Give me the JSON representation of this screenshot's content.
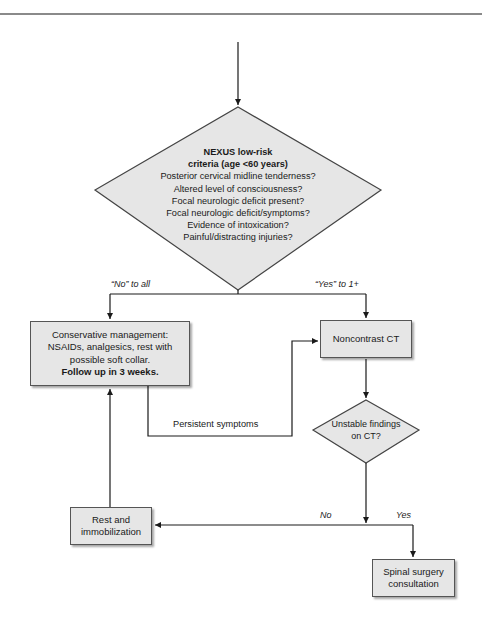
{
  "diagram": {
    "type": "flowchart",
    "colors": {
      "node_fill": "#e6e6e6",
      "stroke": "#1a1a1a",
      "rule": "#8a8a8a"
    },
    "nexus_decision": {
      "title_lines": [
        "NEXUS low-risk",
        "criteria (age <60 years)"
      ],
      "questions": [
        "Posterior cervical midline tenderness?",
        "Altered level of consciousness?",
        "Focal neurologic deficit present?",
        "Focal neurologic deficit/symptoms?",
        "Evidence of intoxication?",
        "Painful/distracting injuries?"
      ]
    },
    "branch_labels": {
      "no_to_all": "“No” to all",
      "yes_to_one": "“Yes” to 1+",
      "persistent": "Persistent symptoms",
      "no": "No",
      "yes": "Yes"
    },
    "conservative_box": {
      "lines": [
        "Conservative management:",
        "NSAIDs, analgesics, rest with",
        "possible soft collar."
      ],
      "bold_line": "Follow up in 3 weeks."
    },
    "ct_box": {
      "label": "Noncontrast CT"
    },
    "unstable_decision": {
      "lines": [
        "Unstable findings",
        "on CT?"
      ]
    },
    "rest_box": {
      "lines": [
        "Rest and",
        "immobilization"
      ]
    },
    "spinal_box": {
      "lines": [
        "Spinal surgery",
        "consultation"
      ]
    }
  }
}
